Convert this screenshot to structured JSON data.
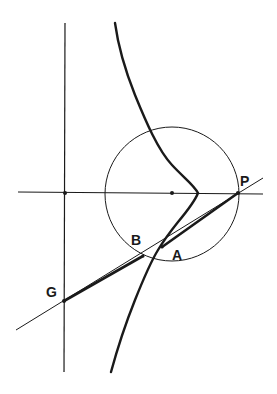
{
  "diagram": {
    "type": "geometric-construction",
    "colors": {
      "background": "#ffffff",
      "ink": "#1a1a1a"
    },
    "points": [
      {
        "id": "P",
        "label": "P",
        "x": 238,
        "y": 193,
        "label_x": 240,
        "label_y": 186
      },
      {
        "id": "A",
        "label": "A",
        "x": 162,
        "y": 247,
        "label_x": 172,
        "label_y": 260
      },
      {
        "id": "B",
        "label": "B",
        "x": 143,
        "y": 256,
        "label_x": 131,
        "label_y": 245
      },
      {
        "id": "G",
        "label": "G",
        "x": 64,
        "y": 301,
        "label_x": 46,
        "label_y": 297
      }
    ],
    "elements": {
      "vertical_axis": "vertical line x=65",
      "horizontal_axis": "horizontal line y=193",
      "circle": "circle centered on horizontal axis through P",
      "secant_line": "line through P, A, B, G",
      "curve": "curve with cusp on horizontal axis"
    }
  }
}
